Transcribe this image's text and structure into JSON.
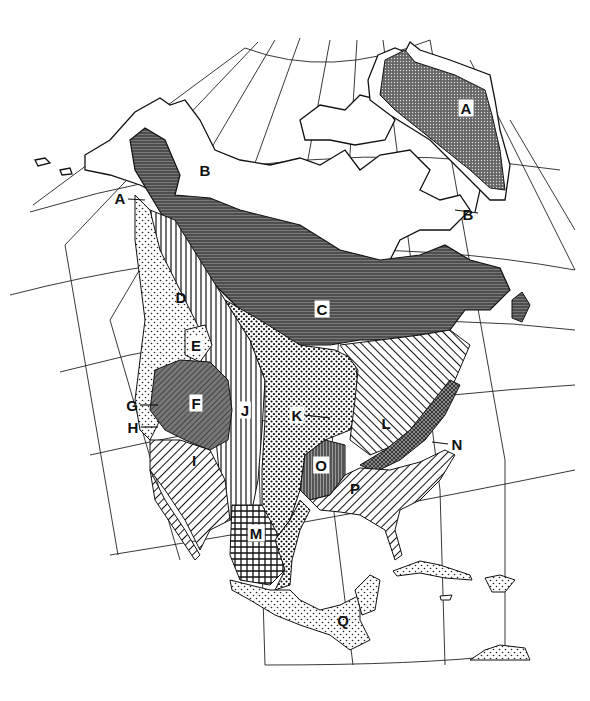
{
  "map": {
    "type": "North America vegetation/ecoregion map",
    "projection": "conic (graticule lines)",
    "colors": {
      "ink": "#111111",
      "paper": "#ffffff",
      "dark_fill": "#555555"
    },
    "legend_visible": false,
    "regions": [
      {
        "id": "A",
        "label": "A",
        "x": 466,
        "y": 108,
        "boxed": true,
        "pattern": "dense-dots-dark",
        "area": "Greenland ice cap"
      },
      {
        "id": "A2",
        "label": "A",
        "x": 120,
        "y": 198,
        "boxed": false,
        "pattern": "leader",
        "area": "Alaska coastal"
      },
      {
        "id": "B",
        "label": "B",
        "x": 205,
        "y": 170,
        "boxed": false,
        "pattern": "none",
        "area": "Arctic tundra (west)"
      },
      {
        "id": "B2",
        "label": "B",
        "x": 468,
        "y": 214,
        "boxed": false,
        "pattern": "none",
        "area": "Arctic tundra (east)"
      },
      {
        "id": "C",
        "label": "C",
        "x": 322,
        "y": 309,
        "boxed": true,
        "pattern": "horizontal-dark",
        "area": "Boreal forest"
      },
      {
        "id": "D",
        "label": "D",
        "x": 181,
        "y": 297,
        "boxed": false,
        "pattern": "light-dots",
        "area": "Pacific coast"
      },
      {
        "id": "E",
        "label": "E",
        "x": 196,
        "y": 345,
        "boxed": true,
        "pattern": "light-dots",
        "area": "Pacific northwest interior"
      },
      {
        "id": "F",
        "label": "F",
        "x": 196,
        "y": 403,
        "boxed": true,
        "pattern": "diagonal-dark",
        "area": "Great Basin"
      },
      {
        "id": "G",
        "label": "G",
        "x": 132,
        "y": 405,
        "boxed": false,
        "pattern": "leader",
        "area": "California coast"
      },
      {
        "id": "H",
        "label": "H",
        "x": 133,
        "y": 427,
        "boxed": false,
        "pattern": "leader",
        "area": "California valley"
      },
      {
        "id": "I",
        "label": "I",
        "x": 194,
        "y": 460,
        "boxed": false,
        "pattern": "diagonal",
        "area": "Southwest desert"
      },
      {
        "id": "J",
        "label": "J",
        "x": 245,
        "y": 410,
        "boxed": true,
        "pattern": "vertical",
        "area": "Rocky Mountains"
      },
      {
        "id": "K",
        "label": "K",
        "x": 297,
        "y": 415,
        "boxed": true,
        "pattern": "dots",
        "area": "Great Plains"
      },
      {
        "id": "L",
        "label": "L",
        "x": 386,
        "y": 423,
        "boxed": false,
        "pattern": "diagonal",
        "area": "Eastern deciduous forest"
      },
      {
        "id": "M",
        "label": "M",
        "x": 256,
        "y": 533,
        "boxed": true,
        "pattern": "grid",
        "area": "Mexican plateau"
      },
      {
        "id": "N",
        "label": "N",
        "x": 457,
        "y": 444,
        "boxed": false,
        "pattern": "leader",
        "area": "Appalachian"
      },
      {
        "id": "O",
        "label": "O",
        "x": 321,
        "y": 465,
        "boxed": true,
        "pattern": "vertical-dark",
        "area": "Southern prairie"
      },
      {
        "id": "P",
        "label": "P",
        "x": 355,
        "y": 488,
        "boxed": false,
        "pattern": "diagonal",
        "area": "Southeastern pine"
      },
      {
        "id": "Q",
        "label": "Q",
        "x": 343,
        "y": 620,
        "boxed": false,
        "pattern": "light-dots",
        "area": "Central America"
      }
    ]
  }
}
